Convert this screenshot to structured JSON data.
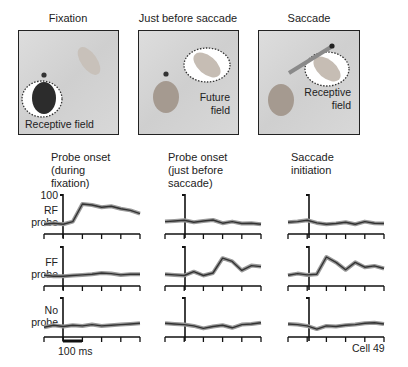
{
  "scenes": [
    {
      "title": "Fixation",
      "label": "Receptive field"
    },
    {
      "title": "Just before saccade",
      "label_line1": "Future",
      "label_line2": "field"
    },
    {
      "title": "Saccade",
      "label_line1": "Receptive",
      "label_line2": "field"
    }
  ],
  "columns": [
    {
      "title_lines": [
        "Probe onset",
        "(during",
        "fixation)"
      ]
    },
    {
      "title_lines": [
        "Probe onset",
        "(just before",
        "saccade)"
      ]
    },
    {
      "title_lines": [
        "Saccade",
        "initiation"
      ]
    }
  ],
  "rows": [
    {
      "label_lines": [
        "RF",
        "probe"
      ]
    },
    {
      "label_lines": [
        "FF",
        "probe"
      ]
    },
    {
      "label_lines": [
        "No",
        "probe"
      ]
    }
  ],
  "y_scale_label": "100",
  "scalebar_label": "100 ms",
  "cell_label": "Cell 49",
  "chart_data": {
    "type": "line",
    "xlabel": "Time (scale bar = 100 ms)",
    "ylabel": "Firing rate (scale bar = 100)",
    "x_ticks_per_panel": 6,
    "panels": [
      {
        "row": "RF probe",
        "column": "Probe onset (during fixation)",
        "x": [
          -100,
          -50,
          0,
          50,
          100,
          150,
          200,
          250,
          300,
          350,
          400
        ],
        "values": [
          12,
          15,
          12,
          20,
          75,
          72,
          65,
          68,
          60,
          55,
          45
        ]
      },
      {
        "row": "RF probe",
        "column": "Probe onset (just before saccade)",
        "x": [
          -100,
          -50,
          0,
          50,
          100,
          150,
          200,
          250,
          300,
          350,
          400
        ],
        "values": [
          20,
          22,
          24,
          18,
          22,
          25,
          15,
          20,
          14,
          15,
          12
        ]
      },
      {
        "row": "RF probe",
        "column": "Saccade initiation",
        "x": [
          -100,
          -50,
          0,
          50,
          100,
          150,
          200,
          250,
          300,
          350,
          400
        ],
        "values": [
          18,
          20,
          24,
          16,
          12,
          14,
          18,
          12,
          20,
          15,
          14
        ]
      },
      {
        "row": "FF probe",
        "column": "Probe onset (during fixation)",
        "x": [
          -100,
          -50,
          0,
          50,
          100,
          150,
          200,
          250,
          300,
          350,
          400
        ],
        "values": [
          15,
          12,
          12,
          14,
          16,
          18,
          22,
          20,
          16,
          18,
          18
        ]
      },
      {
        "row": "FF probe",
        "column": "Probe onset (just before saccade)",
        "x": [
          -100,
          -50,
          0,
          50,
          100,
          150,
          200,
          250,
          300,
          350,
          400
        ],
        "values": [
          18,
          16,
          14,
          26,
          14,
          22,
          68,
          58,
          30,
          45,
          42
        ]
      },
      {
        "row": "FF probe",
        "column": "Saccade initiation",
        "x": [
          -100,
          -50,
          0,
          50,
          100,
          150,
          200,
          250,
          300,
          350,
          400
        ],
        "values": [
          15,
          20,
          16,
          18,
          72,
          55,
          32,
          55,
          40,
          44,
          36
        ]
      },
      {
        "row": "No probe",
        "column": "Probe onset (during fixation)",
        "x": [
          -100,
          -50,
          0,
          50,
          100,
          150,
          200,
          250,
          300,
          350,
          400
        ],
        "values": [
          12,
          18,
          14,
          18,
          16,
          20,
          16,
          18,
          20,
          22,
          24
        ]
      },
      {
        "row": "No probe",
        "column": "Probe onset (just before saccade)",
        "x": [
          -100,
          -50,
          0,
          50,
          100,
          150,
          200,
          250,
          300,
          350,
          400
        ],
        "values": [
          24,
          22,
          20,
          16,
          8,
          14,
          18,
          10,
          20,
          22,
          26
        ]
      },
      {
        "row": "No probe",
        "column": "Saccade initiation",
        "x": [
          -100,
          -50,
          0,
          50,
          100,
          150,
          200,
          250,
          300,
          350,
          400
        ],
        "values": [
          22,
          20,
          16,
          6,
          16,
          14,
          18,
          20,
          24,
          26,
          22
        ]
      }
    ],
    "grid": false,
    "legend": null
  }
}
